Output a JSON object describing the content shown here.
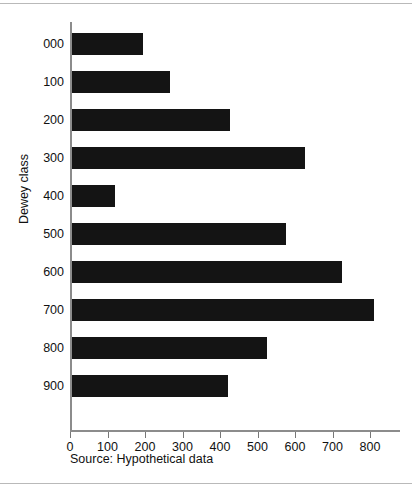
{
  "chart_data": {
    "type": "bar",
    "orientation": "horizontal",
    "title": "",
    "subtitle": "",
    "xlabel": "",
    "ylabel": "Dewey class",
    "categories": [
      "000",
      "100",
      "200",
      "300",
      "400",
      "500",
      "600",
      "700",
      "800",
      "900"
    ],
    "values": [
      190,
      260,
      420,
      620,
      115,
      570,
      720,
      805,
      520,
      415
    ],
    "series": [
      {
        "name": "",
        "values": [
          190,
          260,
          420,
          620,
          115,
          570,
          720,
          805,
          520,
          415
        ]
      }
    ],
    "xlim": [
      0,
      880
    ],
    "xticks": [
      0,
      100,
      200,
      300,
      400,
      500,
      600,
      700,
      800
    ],
    "xtick_labels": [
      "0",
      "100",
      "200",
      "300",
      "400",
      "500",
      "600",
      "700",
      "800"
    ],
    "grid": false,
    "legend": false,
    "legend_position": "none",
    "bar_color": "#141414",
    "axis_color": "#8c8c8c",
    "annotations": [
      "Source: Hypothetical data"
    ]
  },
  "figure": {
    "source_note": "Source: Hypothetical data",
    "axis_title_y": "Dewey class",
    "background": "#ffffff",
    "frame_color": "#b9b9b9"
  }
}
